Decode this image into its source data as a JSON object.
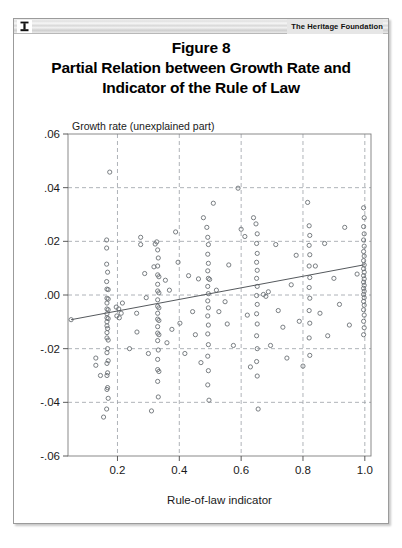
{
  "header": {
    "logo_icon": "heritage-torch-icon",
    "organization": "The Heritage Foundation"
  },
  "title": {
    "figure_number": "Figure 8",
    "line1": "Partial Relation between Growth Rate and",
    "line2": "Indicator of the Rule of Law"
  },
  "colors": {
    "frame": "#9b9b9b",
    "gridline": "#9aa0a6",
    "marker": "#6b7075",
    "fit_line": "#55595d",
    "text": "#1a1a1a",
    "page_background": "#ffffff"
  },
  "chart_data": {
    "type": "scatter",
    "title": "Partial Relation between Growth Rate and Indicator of the Rule of Law",
    "subtitle": "Figure 8",
    "xlabel": "Rule-of-law indicator",
    "ylabel": "Growth rate (unexplained part)",
    "xlim": [
      0.04,
      1.02
    ],
    "ylim": [
      -0.06,
      0.06
    ],
    "xticks": [
      0.2,
      0.4,
      0.6,
      0.8,
      1.0
    ],
    "xtick_labels": [
      "0.2",
      "0.4",
      "0.6",
      "0.8",
      "1.0"
    ],
    "yticks": [
      0.06,
      0.04,
      0.02,
      0.0,
      -0.02,
      -0.04,
      -0.06
    ],
    "ytick_labels": [
      ".06",
      ".04",
      ".02",
      ".00",
      "-.02",
      "-.04",
      "-.06"
    ],
    "grid": true,
    "grid_style": "dashed",
    "legend": null,
    "marker_style": "open-circle",
    "fit_line": {
      "label": "linear fit",
      "x": [
        0.05,
        1.0
      ],
      "y": [
        -0.0092,
        0.0113
      ],
      "slope": 0.0216,
      "intercept": -0.0103
    },
    "points": [
      [
        0.05,
        -0.0092
      ],
      [
        0.13,
        -0.0235
      ],
      [
        0.13,
        -0.0262
      ],
      [
        0.145,
        -0.03
      ],
      [
        0.155,
        -0.0455
      ],
      [
        0.165,
        -0.0425
      ],
      [
        0.175,
        0.0458
      ],
      [
        0.165,
        0.0205
      ],
      [
        0.165,
        0.0175
      ],
      [
        0.165,
        0.0115
      ],
      [
        0.168,
        0.0085
      ],
      [
        0.165,
        0.005
      ],
      [
        0.166,
        0.0022
      ],
      [
        0.17,
        0.002
      ],
      [
        0.166,
        -0.0012
      ],
      [
        0.17,
        -0.0015
      ],
      [
        0.166,
        -0.003
      ],
      [
        0.166,
        -0.0052
      ],
      [
        0.17,
        -0.0055
      ],
      [
        0.166,
        -0.007
      ],
      [
        0.166,
        -0.0085
      ],
      [
        0.17,
        -0.0088
      ],
      [
        0.166,
        -0.01
      ],
      [
        0.166,
        -0.0115
      ],
      [
        0.168,
        -0.0125
      ],
      [
        0.166,
        -0.014
      ],
      [
        0.166,
        -0.016
      ],
      [
        0.17,
        -0.0168
      ],
      [
        0.168,
        -0.02
      ],
      [
        0.166,
        -0.0215
      ],
      [
        0.17,
        -0.0245
      ],
      [
        0.166,
        -0.0255
      ],
      [
        0.168,
        -0.029
      ],
      [
        0.166,
        -0.03
      ],
      [
        0.168,
        -0.0345
      ],
      [
        0.166,
        -0.0352
      ],
      [
        0.17,
        -0.0385
      ],
      [
        0.196,
        -0.0045
      ],
      [
        0.204,
        -0.0052
      ],
      [
        0.198,
        -0.0078
      ],
      [
        0.206,
        -0.0085
      ],
      [
        0.212,
        -0.0068
      ],
      [
        0.216,
        -0.003
      ],
      [
        0.239,
        -0.02
      ],
      [
        0.262,
        -0.0068
      ],
      [
        0.263,
        -0.0138
      ],
      [
        0.275,
        0.0215
      ],
      [
        0.275,
        0.0188
      ],
      [
        0.288,
        0.008
      ],
      [
        0.293,
        -0.001
      ],
      [
        0.3,
        -0.0218
      ],
      [
        0.31,
        -0.0432
      ],
      [
        0.318,
        0.0105
      ],
      [
        0.322,
        0.019
      ],
      [
        0.327,
        0.0198
      ],
      [
        0.33,
        0.0168
      ],
      [
        0.332,
        0.0138
      ],
      [
        0.33,
        0.0108
      ],
      [
        0.33,
        0.0075
      ],
      [
        0.334,
        0.0068
      ],
      [
        0.33,
        0.004
      ],
      [
        0.33,
        0.0015
      ],
      [
        0.334,
        0.0008
      ],
      [
        0.33,
        -0.0018
      ],
      [
        0.33,
        -0.0042
      ],
      [
        0.334,
        -0.0048
      ],
      [
        0.33,
        -0.0068
      ],
      [
        0.33,
        -0.009
      ],
      [
        0.334,
        -0.0095
      ],
      [
        0.33,
        -0.0118
      ],
      [
        0.33,
        -0.0142
      ],
      [
        0.334,
        -0.0148
      ],
      [
        0.33,
        -0.017
      ],
      [
        0.332,
        -0.0205
      ],
      [
        0.33,
        -0.024
      ],
      [
        0.33,
        -0.0278
      ],
      [
        0.334,
        -0.0285
      ],
      [
        0.33,
        -0.0322
      ],
      [
        0.332,
        -0.038
      ],
      [
        0.355,
        0.0055
      ],
      [
        0.36,
        -0.0178
      ],
      [
        0.368,
        0.0018
      ],
      [
        0.376,
        -0.0128
      ],
      [
        0.388,
        0.0235
      ],
      [
        0.396,
        0.0122
      ],
      [
        0.402,
        -0.0105
      ],
      [
        0.418,
        -0.0218
      ],
      [
        0.43,
        0.0072
      ],
      [
        0.443,
        -0.0062
      ],
      [
        0.452,
        -0.0148
      ],
      [
        0.462,
        0.006
      ],
      [
        0.47,
        -0.0252
      ],
      [
        0.478,
        0.0288
      ],
      [
        0.489,
        0.0252
      ],
      [
        0.492,
        0.0215
      ],
      [
        0.494,
        0.0188
      ],
      [
        0.492,
        0.0152
      ],
      [
        0.494,
        0.0118
      ],
      [
        0.492,
        0.009
      ],
      [
        0.494,
        0.0062
      ],
      [
        0.498,
        0.0058
      ],
      [
        0.492,
        0.0032
      ],
      [
        0.494,
        0.0005
      ],
      [
        0.492,
        -0.0022
      ],
      [
        0.494,
        -0.0048
      ],
      [
        0.492,
        -0.0078
      ],
      [
        0.494,
        -0.0112
      ],
      [
        0.492,
        -0.0145
      ],
      [
        0.494,
        -0.0185
      ],
      [
        0.492,
        -0.0228
      ],
      [
        0.494,
        -0.0282
      ],
      [
        0.492,
        -0.0335
      ],
      [
        0.496,
        -0.0392
      ],
      [
        0.51,
        0.0342
      ],
      [
        0.52,
        0.0018
      ],
      [
        0.528,
        -0.0062
      ],
      [
        0.548,
        -0.0025
      ],
      [
        0.555,
        -0.0108
      ],
      [
        0.56,
        0.0112
      ],
      [
        0.575,
        -0.0188
      ],
      [
        0.59,
        0.0398
      ],
      [
        0.6,
        0.0245
      ],
      [
        0.612,
        0.0218
      ],
      [
        0.62,
        -0.0075
      ],
      [
        0.63,
        -0.0268
      ],
      [
        0.64,
        0.0288
      ],
      [
        0.648,
        0.0265
      ],
      [
        0.652,
        0.0228
      ],
      [
        0.65,
        0.0192
      ],
      [
        0.652,
        0.0155
      ],
      [
        0.65,
        0.0122
      ],
      [
        0.652,
        0.0092
      ],
      [
        0.65,
        0.0062
      ],
      [
        0.652,
        0.0032
      ],
      [
        0.65,
        -0.0002
      ],
      [
        0.652,
        -0.0035
      ],
      [
        0.65,
        -0.007
      ],
      [
        0.652,
        -0.0108
      ],
      [
        0.65,
        -0.0152
      ],
      [
        0.652,
        -0.02
      ],
      [
        0.65,
        -0.0248
      ],
      [
        0.652,
        -0.0302
      ],
      [
        0.655,
        -0.0425
      ],
      [
        0.672,
        0.0002
      ],
      [
        0.68,
        -0.0005
      ],
      [
        0.688,
        0.0012
      ],
      [
        0.695,
        -0.0188
      ],
      [
        0.712,
        0.0188
      ],
      [
        0.72,
        -0.0058
      ],
      [
        0.735,
        -0.012
      ],
      [
        0.748,
        -0.0235
      ],
      [
        0.762,
        0.0038
      ],
      [
        0.778,
        0.0148
      ],
      [
        0.788,
        -0.0098
      ],
      [
        0.8,
        -0.0265
      ],
      [
        0.815,
        0.0345
      ],
      [
        0.82,
        0.0258
      ],
      [
        0.822,
        0.0222
      ],
      [
        0.82,
        0.0185
      ],
      [
        0.822,
        0.015
      ],
      [
        0.82,
        0.0108
      ],
      [
        0.822,
        0.0065
      ],
      [
        0.82,
        0.0028
      ],
      [
        0.822,
        -0.0012
      ],
      [
        0.82,
        -0.0058
      ],
      [
        0.822,
        -0.0105
      ],
      [
        0.82,
        -0.016
      ],
      [
        0.822,
        -0.0225
      ],
      [
        0.84,
        0.0108
      ],
      [
        0.855,
        -0.0068
      ],
      [
        0.87,
        0.0192
      ],
      [
        0.88,
        -0.0152
      ],
      [
        0.9,
        0.0062
      ],
      [
        0.918,
        -0.0035
      ],
      [
        0.935,
        0.0252
      ],
      [
        0.95,
        -0.0112
      ],
      [
        0.975,
        0.0078
      ],
      [
        0.996,
        0.0325
      ],
      [
        0.998,
        0.0288
      ],
      [
        0.996,
        0.0255
      ],
      [
        0.998,
        0.0228
      ],
      [
        0.996,
        0.0205
      ],
      [
        0.998,
        0.0182
      ],
      [
        0.996,
        0.0162
      ],
      [
        0.998,
        0.0145
      ],
      [
        0.996,
        0.0128
      ],
      [
        0.998,
        0.0112
      ],
      [
        0.996,
        0.0098
      ],
      [
        0.998,
        0.0085
      ],
      [
        0.996,
        0.0072
      ],
      [
        0.998,
        0.006
      ],
      [
        0.996,
        0.0048
      ],
      [
        0.998,
        0.0036
      ],
      [
        0.996,
        0.0025
      ],
      [
        0.998,
        0.0014
      ],
      [
        0.996,
        0.0002
      ],
      [
        0.998,
        -0.001
      ],
      [
        0.996,
        -0.0024
      ],
      [
        0.998,
        -0.0038
      ],
      [
        0.996,
        -0.0055
      ],
      [
        0.998,
        -0.0075
      ],
      [
        0.996,
        -0.0098
      ],
      [
        0.998,
        -0.0122
      ],
      [
        0.996,
        -0.0148
      ]
    ]
  }
}
